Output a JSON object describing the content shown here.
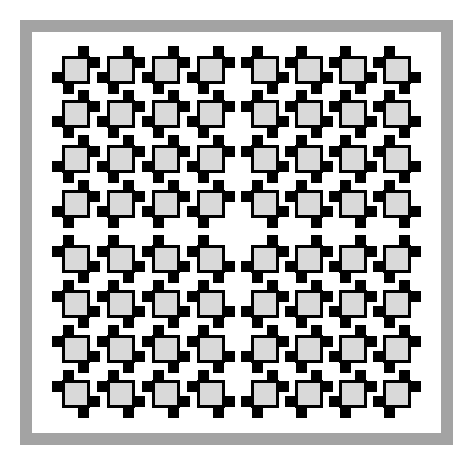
{
  "figure": {
    "colors": {
      "frame": "#a3a3a3",
      "background": "#ffffff",
      "square_fill": "#d9d9d9",
      "square_border": "#000000",
      "notch": "#000000"
    },
    "grid": {
      "rows": 8,
      "cols": 8,
      "col_positions": [
        62,
        107,
        152,
        197,
        251,
        295,
        339,
        383
      ],
      "row_positions": [
        56,
        100,
        145,
        190,
        245,
        290,
        335,
        380
      ],
      "quadrant_types": {
        "top_left": "A",
        "top_right": "B",
        "bottom_left": "B",
        "bottom_right": "A"
      },
      "type_legend": {
        "A": "notches at top-right and bottom-left",
        "B": "notches at top-left and bottom-right"
      }
    }
  }
}
